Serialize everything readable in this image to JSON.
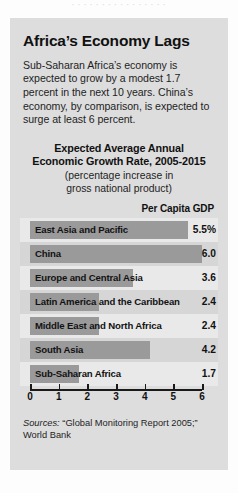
{
  "top_strip": {
    "text": "· · · · · · · · · · · · · · · ·"
  },
  "article": {
    "headline": "Africa’s Economy Lags",
    "lede": "Sub-Saharan Africa’s economy is expected to grow by a modest 1.7 percent in the next 10 years. China’s economy, by comparison, is expected to surge at least 6 percent.",
    "sources_label": "Sources:",
    "sources_text": " “Global Monitoring Report 2005;” World Bank"
  },
  "chart_data": {
    "type": "bar",
    "orientation": "horizontal",
    "title": "Expected Average Annual Economic Growth Rate, 2005-2015",
    "title_line1": "Expected Average Annual",
    "title_line2": "Economic Growth Rate, 2005-2015",
    "subtitle": "(percentage increase in gross national product)",
    "subtitle_line1": "(percentage increase in",
    "subtitle_line2": "gross national product)",
    "value_column_header": "Per Capita GDP",
    "xlabel": "",
    "ylabel": "",
    "xlim": [
      0,
      6
    ],
    "xticks": [
      "0",
      "1",
      "2",
      "3",
      "4",
      "5",
      "6"
    ],
    "grid": false,
    "legend": "none",
    "bar_color": "#9a9a9a",
    "categories": [
      "East Asia and Pacific",
      "China",
      "Europe and Central Asia",
      "Latin America and the Caribbean",
      "Middle East and North Africa",
      "South Asia",
      "Sub-Saharan Africa"
    ],
    "values": [
      5.5,
      6.0,
      3.6,
      2.4,
      2.4,
      4.2,
      1.7
    ],
    "value_labels": [
      "5.5%",
      "6.0",
      "3.6",
      "2.4",
      "2.4",
      "4.2",
      "1.7"
    ]
  }
}
